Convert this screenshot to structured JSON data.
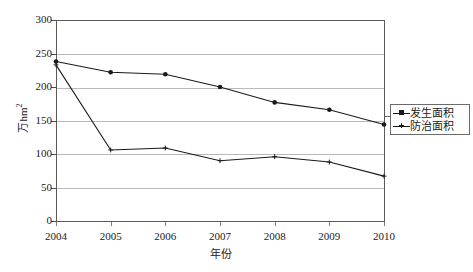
{
  "chart_data": {
    "type": "line",
    "title": "",
    "xlabel": "年份",
    "ylabel": "万hm2",
    "ylabel_main": "万hm",
    "ylabel_sup": "2",
    "categories": [
      "2004",
      "2005",
      "2006",
      "2007",
      "2008",
      "2009",
      "2010"
    ],
    "x": [
      2004,
      2005,
      2006,
      2007,
      2008,
      2009,
      2010
    ],
    "ylim": [
      0,
      300
    ],
    "xlim": [
      2004,
      2010
    ],
    "yticks": [
      0,
      50,
      100,
      150,
      200,
      250,
      300
    ],
    "ytick_labels": [
      "0",
      "50",
      "100",
      "150",
      "200",
      "250",
      "300"
    ],
    "grid": true,
    "grid_axis": "y",
    "legend_position": "right",
    "series": [
      {
        "name": "发生面积",
        "marker": "filled-square",
        "color": "#1a1a1a",
        "values": [
          238,
          222,
          219,
          200,
          177,
          166,
          144
        ]
      },
      {
        "name": "防治面积",
        "marker": "cross",
        "color": "#1a1a1a",
        "values": [
          233,
          106,
          109,
          90,
          96,
          88,
          67
        ]
      }
    ]
  },
  "legend": {
    "items": [
      {
        "label": "发生面积"
      },
      {
        "label": "防治面积"
      }
    ]
  },
  "axes": {
    "y_title_main": "万hm",
    "y_title_sup": "2",
    "x_title": "年份"
  }
}
